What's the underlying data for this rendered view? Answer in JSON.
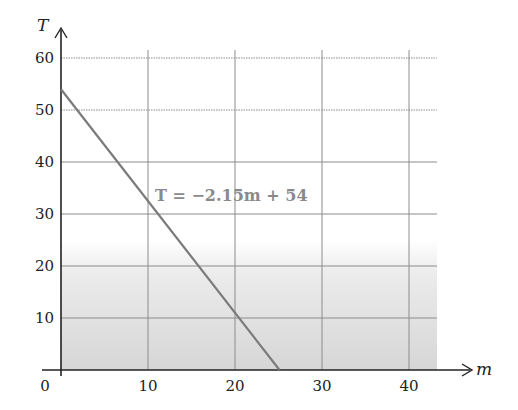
{
  "chart_data": {
    "type": "line",
    "title": "",
    "xlabel": "m",
    "ylabel": "T",
    "xlim": [
      0,
      43
    ],
    "ylim": [
      0,
      62
    ],
    "x_ticks": [
      0,
      10,
      20,
      30,
      40
    ],
    "y_ticks": [
      10,
      20,
      30,
      40,
      50,
      60
    ],
    "x_tick_labels": [
      "0",
      "10",
      "20",
      "30",
      "40"
    ],
    "y_tick_labels": [
      "10",
      "20",
      "30",
      "40",
      "50",
      "60"
    ],
    "grid": true,
    "series": [
      {
        "name": "T = −2.15m + 54",
        "equation": {
          "slope": -2.15,
          "intercept": 54
        },
        "x": [
          0,
          25.12
        ],
        "y": [
          54,
          0
        ]
      }
    ],
    "annotations": [
      {
        "text": "T = −2.15m + 54",
        "x": 10.5,
        "y": 33
      }
    ],
    "shaded_region": {
      "y_from": 0,
      "y_to": 25,
      "style": "gradient gray, darker toward bottom"
    },
    "colors": {
      "line": "#7a7a7a",
      "grid": "#8c8c8c",
      "axis": "#222222",
      "equation": "#8a8a8a",
      "shade": "#d9d9d9"
    }
  },
  "labels": {
    "x_axis": "m",
    "y_axis": "T",
    "origin": "0",
    "equation": "T = −2.15m + 54"
  }
}
